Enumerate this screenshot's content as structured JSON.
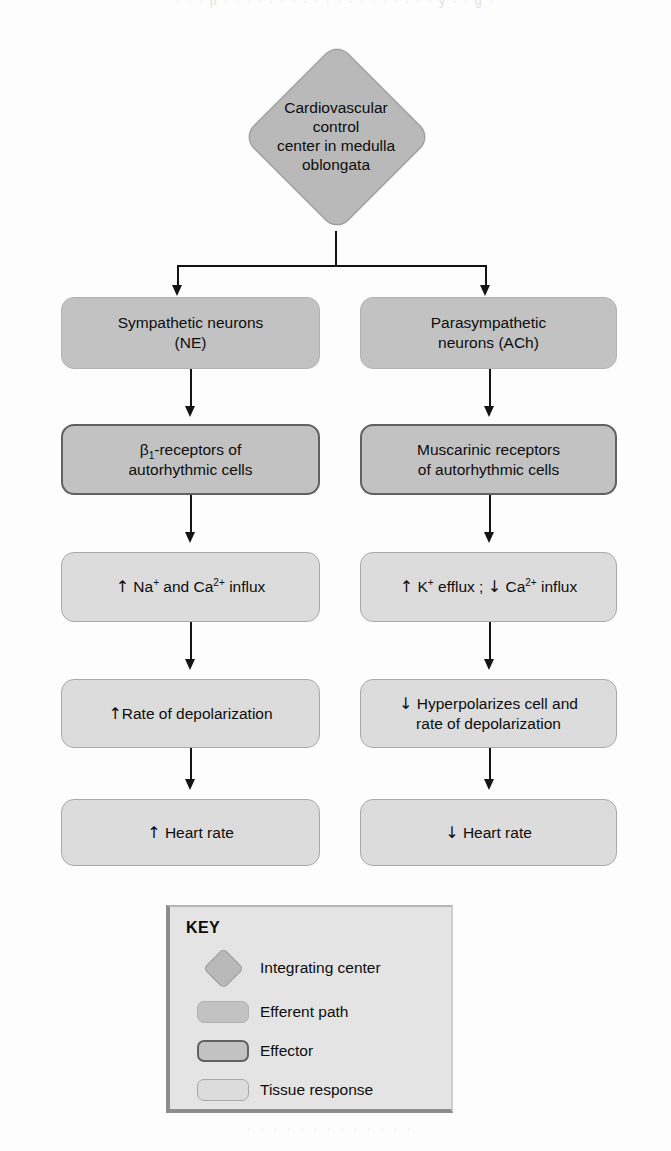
{
  "page": {
    "ghost_text_top": "· · ·   p · · · · · ·   · · · · · · · ·   · · · · · y · · g ·",
    "ghost_text_bottom": "· · · · · · · · · · · · ·"
  },
  "integrating_center": {
    "label": "Cardiovascular\ncontrol\ncenter in medulla\noblongata",
    "shape": "diamond",
    "fill": "#b9b9b9",
    "border": "#9a9a9a"
  },
  "flow": {
    "left_branch": [
      {
        "id": "sympathetic-neurons",
        "text": "Sympathetic neurons\n(NE)",
        "type": "efferent"
      },
      {
        "id": "beta1-receptors",
        "text_html": "β<sub>1</sub>-receptors of\nautorhythmic cells",
        "type": "effector"
      },
      {
        "id": "na-ca-influx",
        "text_html": "↑ Na<sup>+</sup> and Ca<sup>2+</sup> influx",
        "type": "tissue"
      },
      {
        "id": "rate-of-depolarization",
        "text_html": "↑Rate of depolarization",
        "type": "tissue"
      },
      {
        "id": "heart-rate-increase",
        "text_html": "↑ Heart rate",
        "type": "tissue"
      }
    ],
    "right_branch": [
      {
        "id": "parasympathetic-neurons",
        "text": "Parasympathetic\nneurons (ACh)",
        "type": "efferent"
      },
      {
        "id": "muscarinic-receptors",
        "text": "Muscarinic receptors\nof autorhythmic cells",
        "type": "effector"
      },
      {
        "id": "k-efflux-ca-influx",
        "text_html": "↑ K<sup>+</sup> efflux ; ↓ Ca<sup>2+</sup> influx",
        "type": "tissue"
      },
      {
        "id": "hyperpolarizes-cell",
        "text_html": "↓ Hyperpolarizes cell and\nrate of depolarization",
        "type": "tissue"
      },
      {
        "id": "heart-rate-decrease",
        "text_html": "↓ Heart rate",
        "type": "tissue"
      }
    ]
  },
  "key": {
    "title": "KEY",
    "items": [
      {
        "swatch": "diamond",
        "label": "Integrating center"
      },
      {
        "swatch": "efferent",
        "label": "Efferent path"
      },
      {
        "swatch": "effector",
        "label": "Effector"
      },
      {
        "swatch": "tissue",
        "label": "Tissue response"
      }
    ]
  },
  "colors": {
    "integrating_fill": "#b9b9b9",
    "efferent_fill": "#c2c2c2",
    "effector_fill": "#c2c2c2",
    "effector_border": "#616161",
    "tissue_fill": "#dcdcdc",
    "tissue_border": "#a9a9a9",
    "line": "#141414",
    "key_panel_bg": "#e4e4e4",
    "background": "#fdfdfd"
  }
}
